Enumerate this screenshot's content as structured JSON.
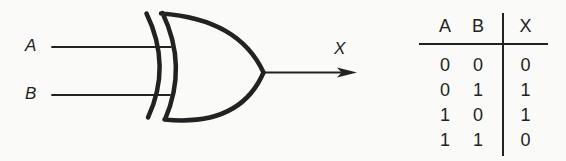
{
  "figure": {
    "labels": {
      "input_a": "A",
      "input_b": "B",
      "output": "X"
    }
  },
  "truth_table": {
    "headers": [
      "A",
      "B",
      "X"
    ],
    "rows": [
      [
        "0",
        "0",
        "0"
      ],
      [
        "0",
        "1",
        "1"
      ],
      [
        "1",
        "0",
        "1"
      ],
      [
        "1",
        "1",
        "0"
      ]
    ]
  },
  "colors": {
    "ink": "#222222",
    "background": "#fafaf8"
  }
}
